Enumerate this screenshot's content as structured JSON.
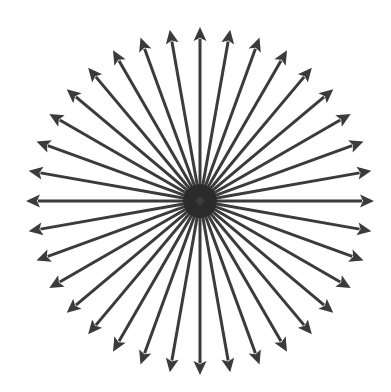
{
  "diagram": {
    "type": "radial-arrows",
    "arrow_count": 36,
    "angle_step_deg": 10,
    "center": {
      "x": 200,
      "y": 201
    },
    "radius": 174,
    "inner_radius": 4,
    "stroke_width": 3,
    "arrowhead": {
      "length": 14,
      "half_width": 6.5
    },
    "center_blob_radius": 17,
    "colors": {
      "arrow": "#3b3b3b",
      "center": "#2a2a2a",
      "background": "#ffffff"
    }
  }
}
